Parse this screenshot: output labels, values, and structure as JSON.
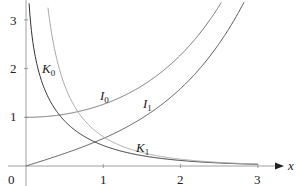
{
  "chart_data": {
    "type": "line",
    "title": "",
    "xlabel": "x",
    "ylabel": "",
    "xlim": [
      0,
      3.15
    ],
    "ylim": [
      0,
      3.2
    ],
    "grid": false,
    "legend": "inline curve labels",
    "x_ticks": [
      "0",
      "1",
      "2",
      "3"
    ],
    "y_ticks": [
      "1",
      "2",
      "3"
    ],
    "series": [
      {
        "name": "I0",
        "label": "I",
        "subscript": "0",
        "color": "#777777",
        "x": [
          0,
          0.5,
          1.0,
          1.5,
          2.0,
          2.5,
          2.95
        ],
        "y": [
          1.0,
          1.063,
          1.266,
          1.647,
          2.28,
          3.29,
          4.6
        ]
      },
      {
        "name": "I1",
        "label": "I",
        "subscript": "1",
        "color": "#555555",
        "x": [
          0,
          0.5,
          1.0,
          1.5,
          2.0,
          2.5,
          3.0
        ],
        "y": [
          0.0,
          0.258,
          0.565,
          0.982,
          1.591,
          2.517,
          3.953
        ]
      },
      {
        "name": "K0",
        "label": "K",
        "subscript": "0",
        "color": "#333333",
        "x": [
          0.02,
          0.05,
          0.1,
          0.2,
          0.5,
          1.0,
          1.5,
          2.0,
          2.5,
          3.0
        ],
        "y": [
          4.0,
          3.114,
          2.427,
          1.753,
          0.924,
          0.421,
          0.214,
          0.114,
          0.062,
          0.035
        ]
      },
      {
        "name": "K1",
        "label": "K",
        "subscript": "1",
        "color": "#aaaaaa",
        "x": [
          0.2,
          0.3,
          0.5,
          1.0,
          1.5,
          2.0,
          2.5,
          3.0
        ],
        "y": [
          4.776,
          3.056,
          1.656,
          0.602,
          0.277,
          0.14,
          0.074,
          0.04
        ]
      }
    ]
  },
  "labels": {
    "I0": {
      "base": "I",
      "sub": "0"
    },
    "I1": {
      "base": "I",
      "sub": "1"
    },
    "K0": {
      "base": "K",
      "sub": "0"
    },
    "K1": {
      "base": "K",
      "sub": "1"
    },
    "x_axis": "x",
    "origin": "0"
  }
}
